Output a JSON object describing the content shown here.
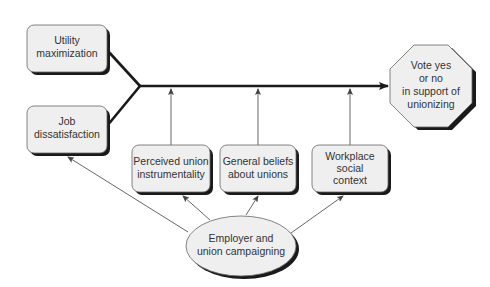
{
  "diagram": {
    "type": "flow",
    "colors": {
      "box_fill": "#efefef",
      "box_border": "#555555",
      "shadow": "#1a1a1a",
      "main_line": "#1a1a1a",
      "thin_line": "#555555",
      "text": "#333333"
    },
    "nodes": {
      "utility": {
        "lines": [
          "Utility",
          "maximization"
        ],
        "shape": "rounded-rect"
      },
      "job": {
        "lines": [
          "Job",
          "dissatisfaction"
        ],
        "shape": "rounded-rect"
      },
      "perceived": {
        "lines": [
          "Perceived union",
          "instrumentality"
        ],
        "shape": "rounded-rect"
      },
      "beliefs": {
        "lines": [
          "General beliefs",
          "about unions"
        ],
        "shape": "rounded-rect"
      },
      "workplace": {
        "lines": [
          "Workplace",
          "social",
          "context"
        ],
        "shape": "rounded-rect"
      },
      "vote": {
        "lines": [
          "Vote yes",
          "or no",
          "in support of",
          "unionizing"
        ],
        "shape": "octagon"
      },
      "campaign": {
        "lines": [
          "Employer and",
          "union campaigning"
        ],
        "shape": "ellipse"
      }
    },
    "edges": [
      {
        "from": "utility",
        "to": "junction",
        "style": "thick"
      },
      {
        "from": "job",
        "to": "junction",
        "style": "thick"
      },
      {
        "from": "junction",
        "to": "vote",
        "style": "thick-arrow"
      },
      {
        "from": "perceived",
        "to": "main-line",
        "style": "thin-arrow"
      },
      {
        "from": "beliefs",
        "to": "main-line",
        "style": "thin-arrow"
      },
      {
        "from": "workplace",
        "to": "main-line",
        "style": "thin-arrow"
      },
      {
        "from": "campaign",
        "to": "job",
        "style": "thin-arrow"
      },
      {
        "from": "campaign",
        "to": "perceived",
        "style": "thin-arrow"
      },
      {
        "from": "campaign",
        "to": "beliefs",
        "style": "thin-arrow"
      },
      {
        "from": "campaign",
        "to": "workplace",
        "style": "thin-arrow"
      }
    ]
  }
}
